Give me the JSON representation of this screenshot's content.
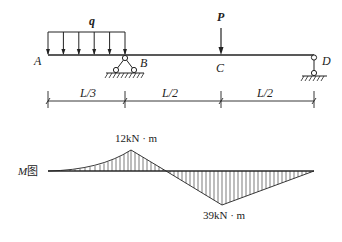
{
  "beam": {
    "points": {
      "A": "A",
      "B": "B",
      "C": "C",
      "D": "D"
    },
    "loads": {
      "distributed": "q",
      "point": "P"
    },
    "dimensions": [
      "L/3",
      "L/2",
      "L/2"
    ]
  },
  "moment_diagram": {
    "label": "M图",
    "label_var": "M",
    "label_suffix": "图",
    "max_positive": "12kN · m",
    "max_negative": "39kN · m"
  }
}
